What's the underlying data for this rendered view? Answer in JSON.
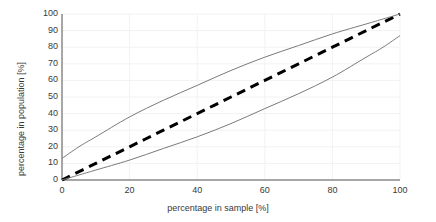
{
  "chart_data": {
    "type": "line",
    "title": "",
    "xlabel": "percentage in sample [%]",
    "ylabel": "percentage in population [%]",
    "xlim": [
      0,
      100
    ],
    "ylim": [
      0,
      100
    ],
    "grid": true,
    "legend": "none",
    "xticks": [
      0,
      20,
      40,
      60,
      80,
      100
    ],
    "yticks": [
      0,
      10,
      20,
      30,
      40,
      50,
      60,
      70,
      80,
      90,
      100
    ],
    "xtick_labels": [
      "0",
      "20",
      "40",
      "60",
      "80",
      "100"
    ],
    "ytick_labels": [
      "0",
      "10",
      "20",
      "30",
      "40",
      "50",
      "60",
      "70",
      "80",
      "90",
      "100"
    ],
    "series": [
      {
        "name": "identity",
        "style": "dashed",
        "color": "#000000",
        "width": 3,
        "x": [
          0,
          10,
          20,
          30,
          40,
          50,
          60,
          70,
          80,
          90,
          100
        ],
        "values": [
          0,
          10,
          20,
          30,
          40,
          50,
          60,
          70,
          80,
          90,
          100
        ]
      },
      {
        "name": "upper confidence bound",
        "style": "solid",
        "color": "#7a7a7a",
        "width": 1,
        "x": [
          0,
          5,
          10,
          20,
          30,
          40,
          50,
          60,
          70,
          80,
          90,
          95,
          100
        ],
        "values": [
          13,
          20,
          26,
          38,
          48,
          57,
          66,
          74,
          81,
          88,
          94,
          97,
          100
        ]
      },
      {
        "name": "lower confidence bound",
        "style": "solid",
        "color": "#7a7a7a",
        "width": 1,
        "x": [
          0,
          5,
          10,
          20,
          30,
          40,
          50,
          60,
          70,
          80,
          90,
          95,
          100
        ],
        "values": [
          0,
          3,
          6,
          12,
          19,
          26,
          34,
          43,
          52,
          62,
          74,
          80,
          87
        ]
      }
    ]
  },
  "axes": {
    "x_title": "percentage in sample [%]",
    "y_title": "percentage in population [%]"
  }
}
